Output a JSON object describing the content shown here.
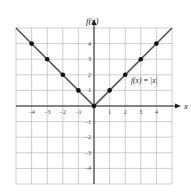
{
  "chart_data": {
    "type": "line",
    "title": "",
    "function_label": "f(x) = |x|",
    "xlabel": "x",
    "ylabel": "f(x)",
    "xlim": [
      -5,
      5
    ],
    "ylim": [
      -5,
      5
    ],
    "grid": true,
    "x_ticks": [
      -4,
      -3,
      -2,
      -1,
      1,
      2,
      3,
      4
    ],
    "y_ticks": [
      4,
      3,
      2,
      1,
      -1,
      -2,
      -3,
      -4
    ],
    "series": [
      {
        "name": "f(x) = |x|",
        "points": [
          {
            "x": -4,
            "y": 4
          },
          {
            "x": -3,
            "y": 3
          },
          {
            "x": -2,
            "y": 2
          },
          {
            "x": -1,
            "y": 1
          },
          {
            "x": 0,
            "y": 0
          },
          {
            "x": 1,
            "y": 1
          },
          {
            "x": 2,
            "y": 2
          },
          {
            "x": 3,
            "y": 3
          },
          {
            "x": 4,
            "y": 4
          }
        ],
        "line_extent_x": [
          -5,
          5
        ],
        "color": "#555555",
        "marker_color": "#111111"
      }
    ]
  }
}
